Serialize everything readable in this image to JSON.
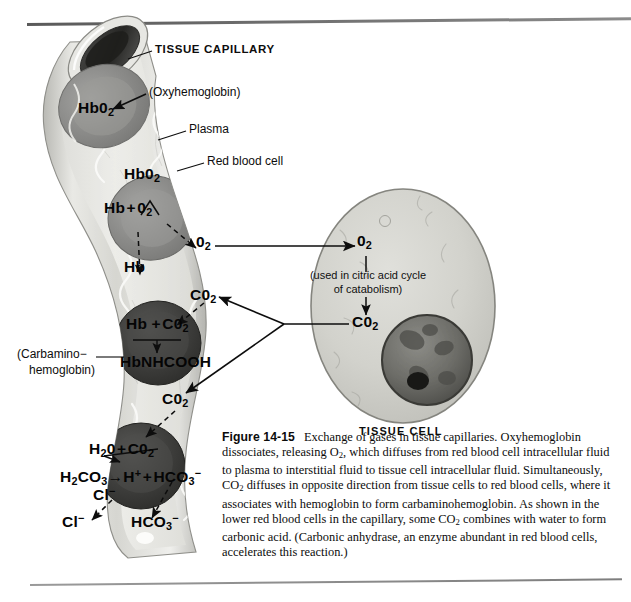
{
  "figure": {
    "number": "Figure 14-15",
    "caption": "Exchange of gases in tissue capillaries. Oxyhemoglobin dissociates, releasing O2, which diffuses from red blood cell intracellular fluid to plasma to interstitial fluid to tissue cell intracellular fluid. Simultaneously, CO2 diffuses in opposite direction from tissue cells to red blood cells, where it associates with hemoglobin to form carbaminohemoglobin. As shown in the lower red blood cells in the capillary, some CO2 combines with water to form carbonic acid. (Carbonic anhydrase, an enzyme abundant in red blood cells, accelerates this reaction.)"
  },
  "labels": {
    "tissue_capillary": "TISSUE CAPILLARY",
    "oxyhemoglobin": "(Oxyhemoglobin)",
    "plasma": "Plasma",
    "red_blood_cell": "Red blood cell",
    "carbamino_line1": "(Carbamino−",
    "carbamino_line2": "hemoglobin)",
    "tissue_cell": "TISSUE CELL"
  },
  "chemistry": {
    "rbc1_hbo2": "HbO2",
    "rbc2_hbo2": "HbO2",
    "rbc2_products": "Hb + O2",
    "plasma_hb": "Hb",
    "plasma_o2": "O2",
    "plasma_co2_upper": "CO2",
    "rbc3_reactants": "Hb + CO2",
    "rbc3_product": "HbNHCOOH",
    "plasma_co2_lower": "CO2",
    "rbc4_reactants": "H2O + CO2",
    "rbc4_equation_left": "H2CO3",
    "rbc4_equation_right": "H+ + HCO3-",
    "rbc4_chloride": "Cl-",
    "plasma_chloride": "Cl-",
    "plasma_bicarbonate": "HCO3-"
  },
  "tissue_cell": {
    "o2": "O2",
    "note_line1": "(used in citric acid cycle",
    "note_line2": "of catabolism)",
    "co2": "CO2"
  },
  "colors": {
    "capillary_wall": "#d8d8d4",
    "plasma": "#e6e6e2",
    "rbc_light": "#8e8e8e",
    "rbc_dark": "#3f3f3f",
    "tissue_cell": "#cfcfc9",
    "nucleus": "#6e6e6a",
    "ink": "#0d0d0d",
    "rule": "#6d6d6d"
  }
}
